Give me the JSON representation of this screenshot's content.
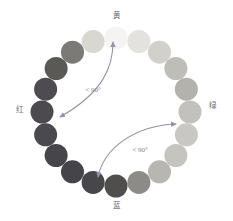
{
  "figure": {
    "type": "color-wheel-diagram",
    "background_color": "#ffffff",
    "width": 233,
    "height": 221
  },
  "ring": {
    "center_x": 116,
    "center_y": 112,
    "radius": 74,
    "dot_radius": 11.5,
    "count": 20,
    "start_angle_deg": -90,
    "dots": [
      {
        "index": 0,
        "angle_deg": -90,
        "color": "#f6f4f2"
      },
      {
        "index": 1,
        "angle_deg": -72,
        "color": "#e4e2de"
      },
      {
        "index": 2,
        "angle_deg": -54,
        "color": "#d2d0cb"
      },
      {
        "index": 3,
        "angle_deg": -36,
        "color": "#bfbdb8"
      },
      {
        "index": 4,
        "angle_deg": -18,
        "color": "#b4b2ad"
      },
      {
        "index": 5,
        "angle_deg": 0,
        "color": "#c3c1bd"
      },
      {
        "index": 6,
        "angle_deg": 18,
        "color": "#c9c7c3"
      },
      {
        "index": 7,
        "angle_deg": 36,
        "color": "#c6c4bf"
      },
      {
        "index": 8,
        "angle_deg": 54,
        "color": "#b8b6b1"
      },
      {
        "index": 9,
        "angle_deg": 72,
        "color": "#8d8b88"
      },
      {
        "index": 10,
        "angle_deg": 90,
        "color": "#4f4e4c"
      },
      {
        "index": 11,
        "angle_deg": 108,
        "color": "#47464a"
      },
      {
        "index": 12,
        "angle_deg": 126,
        "color": "#454449"
      },
      {
        "index": 13,
        "angle_deg": 144,
        "color": "#46454a"
      },
      {
        "index": 14,
        "angle_deg": 162,
        "color": "#4a494d"
      },
      {
        "index": 15,
        "angle_deg": 180,
        "color": "#4c4a4e"
      },
      {
        "index": 16,
        "angle_deg": 198,
        "color": "#4e4c50"
      },
      {
        "index": 17,
        "angle_deg": 216,
        "color": "#5b5956"
      },
      {
        "index": 18,
        "angle_deg": 234,
        "color": "#7c7a76"
      },
      {
        "index": 19,
        "angle_deg": 252,
        "color": "#d9d7d2"
      }
    ]
  },
  "labels": {
    "top": {
      "text": "黄",
      "x": 116,
      "y": 16,
      "color": "#6b6b6b"
    },
    "right": {
      "text": "绿",
      "x": 212,
      "y": 106,
      "color": "#6b6b6b"
    },
    "bottom": {
      "text": "蓝",
      "x": 116,
      "y": 206,
      "color": "#6b6b6b"
    },
    "left": {
      "text": "红",
      "x": 19,
      "y": 110,
      "color": "#6b6b6b"
    }
  },
  "annotations": [
    {
      "id": "upper-angle",
      "text": "< 90°",
      "x": 93,
      "y": 90,
      "color": "#8a7f92",
      "arrow_color": "#9b8fa6",
      "path": "M 113 42 C 113 66, 104 92, 60 117",
      "arrow_start": true,
      "arrow_end": true
    },
    {
      "id": "lower-angle",
      "text": "< 90°",
      "x": 140,
      "y": 150,
      "color": "#8a7f92",
      "arrow_color": "#9b8fa6",
      "path": "M 98 177 C 104 148, 134 126, 176 124",
      "arrow_start": true,
      "arrow_end": true
    }
  ]
}
